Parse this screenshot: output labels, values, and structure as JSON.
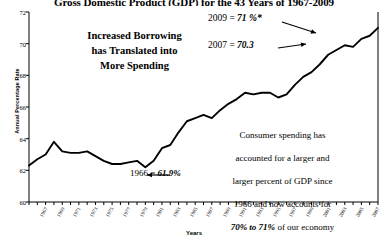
{
  "title": "Gross Domestic Product (GDP) for the 43 Years of 1967-2009",
  "axis": {
    "ylabel": "Annual Percentage Rate",
    "xlabel": "Years",
    "yticks": [
      "60",
      "62",
      "64",
      "66",
      "68",
      "70",
      "72"
    ],
    "xticks": [
      "1967",
      "1969",
      "1971",
      "1973",
      "1975",
      "1977",
      "1979",
      "1981",
      "1983",
      "1985",
      "1987",
      "1989",
      "1991",
      "1993",
      "1995",
      "1997",
      "1999",
      "2001",
      "2003",
      "2005",
      "2007"
    ]
  },
  "annotations": {
    "headline": "Increased Borrowing\nhas Translated into\nMore Spending",
    "point_2009_label": "2009 = ",
    "point_2009_value": "71 %*",
    "point_2007_label": "2007 = ",
    "point_2007_value": "70.3",
    "point_1966_label": "1966 = ",
    "point_1966_value": "61.9%",
    "paragraph_line1": "Consumer spending has",
    "paragraph_line2": "accounted for a larger and",
    "paragraph_line3": "larger percent of GDP since",
    "paragraph_line4": "1966 and now accounts for",
    "paragraph_emph": "70% to 71%",
    "paragraph_line5": " of our economy"
  },
  "colors": {
    "line": "#000000",
    "axis": "#000000",
    "background": "#ffffff"
  },
  "chart_data": {
    "type": "line",
    "title": "Gross Domestic Product (GDP) for the 43 Years of 1967-2009",
    "xlabel": "Years",
    "ylabel": "Annual Percentage Rate",
    "ylim": [
      60,
      72
    ],
    "xlim": [
      1967,
      2009
    ],
    "grid": false,
    "legend": null,
    "series": [
      {
        "name": "Consumer spending as percent of GDP",
        "x": [
          1967,
          1968,
          1969,
          1970,
          1971,
          1972,
          1973,
          1974,
          1975,
          1976,
          1977,
          1978,
          1979,
          1980,
          1981,
          1982,
          1983,
          1984,
          1985,
          1986,
          1987,
          1988,
          1989,
          1990,
          1991,
          1992,
          1993,
          1994,
          1995,
          1996,
          1997,
          1998,
          1999,
          2000,
          2001,
          2002,
          2003,
          2004,
          2005,
          2006,
          2007,
          2008,
          2009
        ],
        "values": [
          62.3,
          62.7,
          63.0,
          63.8,
          63.2,
          63.1,
          63.1,
          63.2,
          62.9,
          62.6,
          62.4,
          62.4,
          62.5,
          62.6,
          62.2,
          62.6,
          63.4,
          63.6,
          64.4,
          65.1,
          65.3,
          65.5,
          65.3,
          65.8,
          66.2,
          66.5,
          66.9,
          66.8,
          66.9,
          66.9,
          66.6,
          66.8,
          67.4,
          67.9,
          68.2,
          68.7,
          69.3,
          69.6,
          69.9,
          69.8,
          70.3,
          70.5,
          71.0
        ]
      }
    ],
    "highlights": [
      {
        "label": "1966",
        "value": 61.9,
        "text": "1966 = 61.9%"
      },
      {
        "label": "2007",
        "value": 70.3,
        "text": "2007 = 70.3"
      },
      {
        "label": "2009",
        "value": 71.0,
        "text": "2009 = 71 %*"
      }
    ]
  }
}
